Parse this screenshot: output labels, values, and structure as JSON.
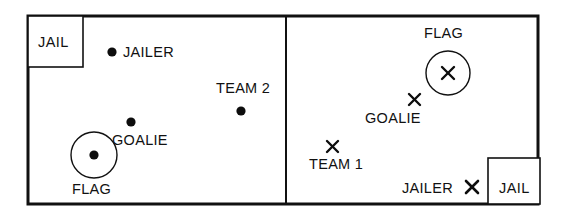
{
  "diagram": {
    "type": "schematic-field-diagram",
    "colors": {
      "line": "#111111",
      "marker": "#0d0d0d",
      "background": "#ffffff"
    },
    "field": {
      "x": 28,
      "y": 16,
      "width": 510,
      "height": 188,
      "border_width": 3,
      "center_divider_x": 286,
      "center_divider_width": 2
    },
    "zones": [
      {
        "name": "left-half",
        "team": "TEAM 2",
        "marker_style": "filled-dot"
      },
      {
        "name": "right-half",
        "team": "TEAM 1",
        "marker_style": "x-cross"
      }
    ],
    "jails": [
      {
        "label": "JAIL",
        "side": "left",
        "x": 28,
        "y": 16,
        "width": 55,
        "height": 51,
        "label_x": 38,
        "label_y": 35
      },
      {
        "label": "JAIL",
        "side": "right",
        "x": 488,
        "y": 158,
        "width": 52,
        "height": 46,
        "label_x": 499,
        "label_y": 181
      }
    ],
    "flags": [
      {
        "label": "FLAG",
        "side": "left",
        "circle_cx": 94,
        "circle_cy": 155,
        "circle_r": 23,
        "marker": "filled-dot",
        "marker_size": 9,
        "label_x": 72,
        "label_y": 182
      },
      {
        "label": "FLAG",
        "side": "right",
        "circle_cx": 448,
        "circle_cy": 73,
        "circle_r": 22,
        "marker": "x-cross",
        "marker_size": 17,
        "label_x": 424,
        "label_y": 26
      }
    ],
    "players": [
      {
        "label": "JAILER",
        "side": "left",
        "marker": "filled-dot",
        "marker_size": 9,
        "marker_x": 112,
        "marker_y": 52,
        "label_x": 123,
        "label_y": 45,
        "label_position": "right"
      },
      {
        "label": "GOALIE",
        "side": "left",
        "marker": "filled-dot",
        "marker_size": 9,
        "marker_x": 131,
        "marker_y": 122,
        "label_x": 112,
        "label_y": 133,
        "label_position": "below"
      },
      {
        "label": "TEAM 2",
        "side": "left",
        "marker": "filled-dot",
        "marker_size": 9,
        "marker_x": 241,
        "marker_y": 111,
        "label_x": 216,
        "label_y": 81,
        "label_position": "above"
      },
      {
        "label": "GOALIE",
        "side": "right",
        "marker": "x-cross",
        "marker_size": 15,
        "marker_x": 414,
        "marker_y": 99,
        "label_x": 365,
        "label_y": 111,
        "label_position": "below"
      },
      {
        "label": "TEAM 1",
        "side": "right",
        "marker": "x-cross",
        "marker_size": 15,
        "marker_x": 332,
        "marker_y": 146,
        "label_x": 309,
        "label_y": 157,
        "label_position": "below"
      },
      {
        "label": "JAILER",
        "side": "right",
        "marker": "x-cross",
        "marker_size": 15,
        "marker_x": 472,
        "marker_y": 187,
        "label_x": 402,
        "label_y": 181,
        "label_position": "left"
      }
    ]
  }
}
